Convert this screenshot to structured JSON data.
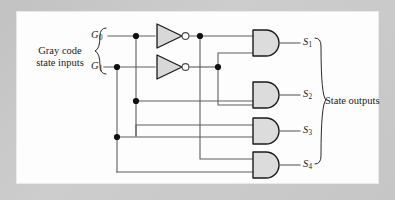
{
  "figure": {
    "type": "logic-circuit-diagram",
    "panel_background": "#fdfdfd",
    "outer_background": "#c9c9c9",
    "wire_color": "#5e5e5e",
    "gate_fill": "#dcdcdc",
    "gate_stroke": "#1a1a1a"
  },
  "inputs": {
    "group_label_line1": "Gray code",
    "group_label_line2": "state inputs",
    "signals": [
      {
        "name": "G",
        "subscript": "0",
        "y": 36
      },
      {
        "name": "G",
        "subscript": "1",
        "y": 67
      }
    ]
  },
  "outputs": {
    "group_label": "State outputs",
    "signals": [
      {
        "name": "S",
        "subscript": "1",
        "y": 43
      },
      {
        "name": "S",
        "subscript": "2",
        "y": 95
      },
      {
        "name": "S",
        "subscript": "3",
        "y": 131
      },
      {
        "name": "S",
        "subscript": "4",
        "y": 165
      }
    ]
  },
  "gates": {
    "inverters": [
      {
        "id": "inv-g0",
        "input": "G0",
        "output": "notG0",
        "y": 36
      },
      {
        "id": "inv-g1",
        "input": "G1",
        "output": "notG1",
        "y": 67
      }
    ],
    "and_gates": [
      {
        "id": "and-s1",
        "output": "S1",
        "inputs": [
          "notG0",
          "notG1"
        ],
        "y": 43
      },
      {
        "id": "and-s2",
        "output": "S2",
        "inputs": [
          "G0",
          "notG1"
        ],
        "y": 95
      },
      {
        "id": "and-s3",
        "output": "S3",
        "inputs": [
          "G0",
          "G1"
        ],
        "y": 131
      },
      {
        "id": "and-s4",
        "output": "S4",
        "inputs": [
          "notG0",
          "G1"
        ],
        "y": 165
      }
    ]
  }
}
